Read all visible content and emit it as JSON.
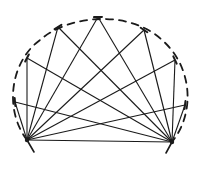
{
  "diagram": {
    "type": "line-drawing",
    "colors": {
      "ink": "#1a1a1a",
      "background": "#ffffff"
    },
    "base_points": [
      {
        "id": "A",
        "x": 27,
        "y": 140
      },
      {
        "id": "B",
        "x": 172,
        "y": 142
      }
    ],
    "arc_points": [
      {
        "id": "P1",
        "x": 15,
        "y": 102
      },
      {
        "id": "P2",
        "x": 27,
        "y": 58
      },
      {
        "id": "P3",
        "x": 58,
        "y": 27
      },
      {
        "id": "P4",
        "x": 98,
        "y": 17
      },
      {
        "id": "P5",
        "x": 144,
        "y": 30
      },
      {
        "id": "P6",
        "x": 175,
        "y": 60
      },
      {
        "id": "P7",
        "x": 185,
        "y": 105
      }
    ],
    "arc": {
      "style": "dashed",
      "from": "A",
      "to": "B",
      "through": "top"
    },
    "chord": {
      "from": "A",
      "to": "B",
      "style": "solid"
    },
    "tails": [
      {
        "from": "A",
        "x2": 34,
        "y2": 152
      },
      {
        "from": "B",
        "x2": 166,
        "y2": 153
      }
    ]
  }
}
